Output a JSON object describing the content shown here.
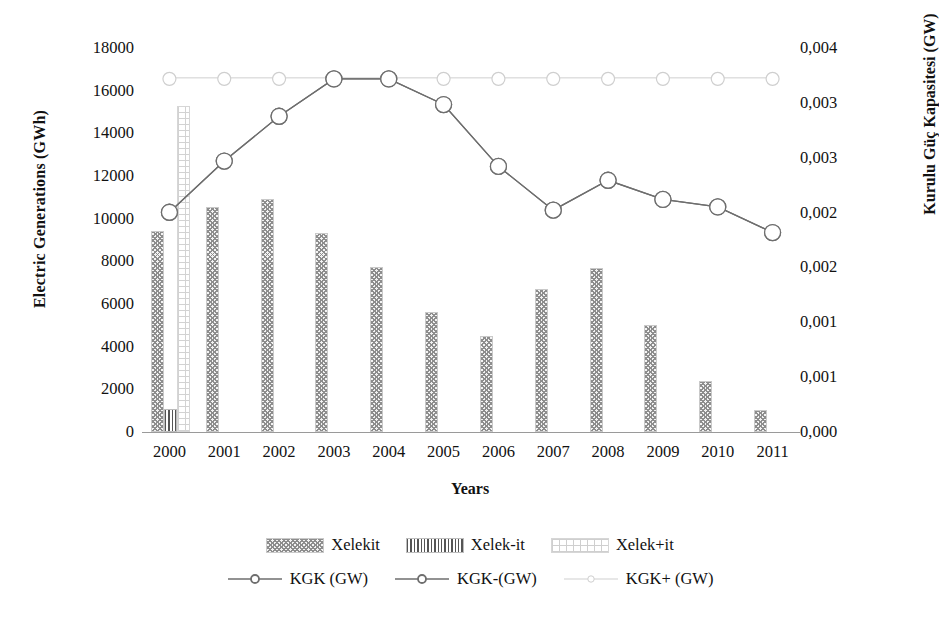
{
  "chart_data": {
    "type": "bar",
    "title": "",
    "xlabel": "Years",
    "ylabel": "Electric Generations (GWh)",
    "y2label": "Kurulu Güç Kapasitesi (GW)",
    "grid": false,
    "legend_position": "bottom",
    "categories": [
      "2000",
      "2001",
      "2002",
      "2003",
      "2004",
      "2005",
      "2006",
      "2007",
      "2008",
      "2009",
      "2010",
      "2011"
    ],
    "ylim": [
      0,
      18000
    ],
    "yticks": [
      "0",
      "2000",
      "4000",
      "6000",
      "8000",
      "10000",
      "12000",
      "14000",
      "16000",
      "18000"
    ],
    "y2lim": [
      0,
      0.004
    ],
    "y2ticks": [
      "0,000",
      "0,001",
      "0,001",
      "0,002",
      "0,002",
      "0,003",
      "0,003",
      "0,004"
    ],
    "series": [
      {
        "name": "Xelekit",
        "kind": "bar",
        "axis": "left",
        "values": [
          9350,
          10450,
          10850,
          9250,
          7650,
          5550,
          4400,
          6600,
          7600,
          4900,
          2300,
          950
        ]
      },
      {
        "name": "Xelek-it",
        "kind": "bar",
        "axis": "left",
        "values": [
          1000,
          null,
          null,
          null,
          null,
          null,
          null,
          null,
          null,
          null,
          null,
          null
        ]
      },
      {
        "name": "Xelek+it",
        "kind": "bar",
        "axis": "left",
        "values": [
          15200,
          null,
          null,
          null,
          null,
          null,
          null,
          null,
          null,
          null,
          null,
          null
        ]
      },
      {
        "name": "KGK (GW)",
        "kind": "line",
        "axis": "left",
        "values": [
          10300,
          12700,
          14800,
          16550,
          16550,
          15350,
          12450,
          10400,
          11800,
          10900,
          10550,
          9350
        ]
      },
      {
        "name": "KGK-(GW)",
        "kind": "line",
        "axis": "left",
        "values": [
          10300,
          12700,
          14800,
          16550,
          16550,
          15350,
          12450,
          10400,
          11800,
          10900,
          10550,
          9350
        ]
      },
      {
        "name": "KGK+ (GW)",
        "kind": "line",
        "axis": "left",
        "values": [
          16600,
          16600,
          16600,
          16600,
          16600,
          16600,
          16600,
          16600,
          16600,
          16600,
          16600,
          16600
        ]
      }
    ]
  },
  "legend": {
    "row1": [
      {
        "label": "Xelekit",
        "marker": "checkered-swatch"
      },
      {
        "label": "Xelek-it",
        "marker": "striped-swatch"
      },
      {
        "label": "Xelek+it",
        "marker": "dotted-swatch"
      }
    ],
    "row2": [
      {
        "label": "KGK (GW)",
        "marker": "line-circle-marker"
      },
      {
        "label": "KGK-(GW)",
        "marker": "line-circle-marker"
      },
      {
        "label": "KGK+ (GW)",
        "marker": "light-line-marker"
      }
    ]
  },
  "colors": {
    "line": "#6e6e6e",
    "line_light": "#cfcfcf",
    "bar_fill": "#bdbdbd",
    "axis": "#9a9a9a",
    "text": "#111111"
  }
}
